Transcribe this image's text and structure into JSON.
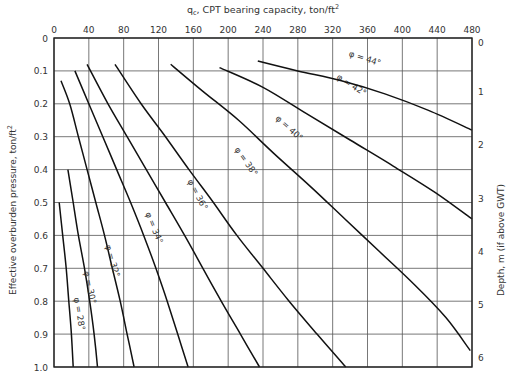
{
  "chart_data": {
    "type": "line",
    "title": "",
    "top_axis": {
      "label": "q_c, CPT bearing capacity, ton/ft²",
      "label_main": "q",
      "label_sub": "c",
      "label_rest": ", CPT bearing capacity, ton/ft",
      "label_sup": "2",
      "range": [
        0,
        480
      ],
      "ticks": [
        0,
        40,
        80,
        120,
        160,
        200,
        240,
        280,
        320,
        360,
        400,
        440,
        480
      ]
    },
    "left_axis": {
      "label": "Effective overburden pressure, ton/ft²",
      "label_text": "Effective overburden pressure, ton/ft",
      "label_sup": "2",
      "range": [
        0,
        1.0
      ],
      "inverted": true,
      "ticks": [
        "0",
        "0.1",
        "0.2",
        "0.3",
        "0.4",
        "0.5",
        "0.6",
        "0.7",
        "0.8",
        "0.9",
        "1.0"
      ]
    },
    "right_axis": {
      "label": "Depth, m  (if above GWT)",
      "range": [
        0,
        6.2
      ],
      "ticks": [
        "0",
        "1",
        "2",
        "3",
        "4",
        "5",
        "6"
      ],
      "tick_positions_sigma": [
        0,
        0.162,
        0.323,
        0.485,
        0.646,
        0.808,
        0.97
      ]
    },
    "grid": true,
    "legend": "inline curve labels",
    "series": [
      {
        "name": "φ = 28°",
        "label": "φ = 28°",
        "points": [
          [
            6,
            0.5
          ],
          [
            10,
            0.6
          ],
          [
            14,
            0.7
          ],
          [
            17,
            0.8
          ],
          [
            20,
            0.9
          ],
          [
            22,
            1.0
          ]
        ],
        "label_pos": [
          26,
          0.84
        ],
        "label_angle": 80
      },
      {
        "name": "φ = 30°",
        "label": "φ = 30°",
        "points": [
          [
            16,
            0.4
          ],
          [
            22,
            0.5
          ],
          [
            28,
            0.6
          ],
          [
            35,
            0.7
          ],
          [
            41,
            0.8
          ],
          [
            46,
            0.9
          ],
          [
            50,
            1.0
          ]
        ],
        "label_pos": [
          38,
          0.76
        ],
        "label_angle": 78
      },
      {
        "name": "φ = 32°",
        "label": "φ = 32°",
        "points": [
          [
            8,
            0.13
          ],
          [
            18,
            0.2
          ],
          [
            28,
            0.3
          ],
          [
            38,
            0.4
          ],
          [
            48,
            0.5
          ],
          [
            58,
            0.6
          ],
          [
            67,
            0.7
          ],
          [
            76,
            0.8
          ],
          [
            84,
            0.9
          ],
          [
            92,
            1.0
          ]
        ],
        "label_pos": [
          64,
          0.68
        ],
        "label_angle": 74
      },
      {
        "name": "φ = 34°",
        "label": "φ = 34°",
        "points": [
          [
            24,
            0.1
          ],
          [
            40,
            0.2
          ],
          [
            56,
            0.3
          ],
          [
            72,
            0.4
          ],
          [
            88,
            0.5
          ],
          [
            103,
            0.6
          ],
          [
            117,
            0.7
          ],
          [
            130,
            0.8
          ],
          [
            142,
            0.9
          ],
          [
            154,
            1.0
          ]
        ],
        "label_pos": [
          112,
          0.58
        ],
        "label_angle": 68
      },
      {
        "name": "φ = 36°",
        "label": "φ = 36°",
        "points": [
          [
            38,
            0.08
          ],
          [
            62,
            0.2
          ],
          [
            84,
            0.3
          ],
          [
            106,
            0.4
          ],
          [
            128,
            0.5
          ],
          [
            150,
            0.6
          ],
          [
            171,
            0.7
          ],
          [
            192,
            0.8
          ],
          [
            214,
            0.9
          ],
          [
            236,
            1.0
          ]
        ],
        "label_pos": [
          162,
          0.48
        ],
        "label_angle": 62
      },
      {
        "name": "φ = 38°",
        "label": "φ = 38°",
        "points": [
          [
            70,
            0.08
          ],
          [
            100,
            0.2
          ],
          [
            128,
            0.3
          ],
          [
            155,
            0.4
          ],
          [
            183,
            0.5
          ],
          [
            210,
            0.6
          ],
          [
            240,
            0.7
          ],
          [
            270,
            0.8
          ],
          [
            302,
            0.9
          ],
          [
            335,
            1.0
          ]
        ],
        "label_pos": [
          218,
          0.38
        ],
        "label_angle": 55
      },
      {
        "name": "φ = 40°",
        "label": "φ = 40°",
        "points": [
          [
            134,
            0.08
          ],
          [
            170,
            0.16
          ],
          [
            212,
            0.25
          ],
          [
            252,
            0.35
          ],
          [
            294,
            0.45
          ],
          [
            334,
            0.55
          ],
          [
            374,
            0.65
          ],
          [
            414,
            0.75
          ],
          [
            450,
            0.85
          ],
          [
            478,
            0.95
          ]
        ],
        "label_pos": [
          268,
          0.28
        ],
        "label_angle": 42
      },
      {
        "name": "φ = 42°",
        "label": "φ = 42°",
        "points": [
          [
            190,
            0.09
          ],
          [
            240,
            0.15
          ],
          [
            290,
            0.23
          ],
          [
            340,
            0.31
          ],
          [
            390,
            0.39
          ],
          [
            438,
            0.47
          ],
          [
            480,
            0.55
          ]
        ],
        "label_pos": [
          340,
          0.15
        ],
        "label_angle": 32
      },
      {
        "name": "φ = 44°",
        "label": "φ = 44°",
        "points": [
          [
            234,
            0.07
          ],
          [
            280,
            0.1
          ],
          [
            330,
            0.13
          ],
          [
            380,
            0.17
          ],
          [
            430,
            0.22
          ],
          [
            480,
            0.28
          ]
        ],
        "label_pos": [
          356,
          0.07
        ],
        "label_angle": 18
      }
    ]
  }
}
